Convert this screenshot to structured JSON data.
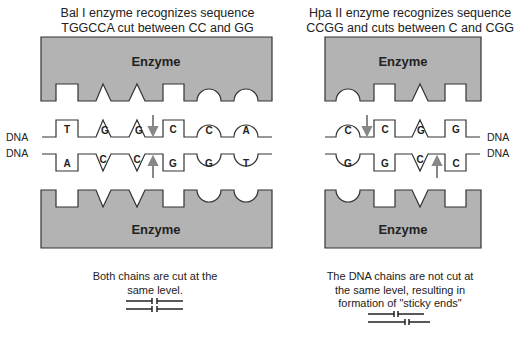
{
  "left_panel": {
    "title_line1": "Bal I enzyme recognizes sequence",
    "title_line2": "TGGCCA cut between CC and GG",
    "top_enzyme_label": "Enzyme",
    "bottom_enzyme_label": "Enzyme",
    "top_strand_label": "DNA",
    "bottom_strand_label": "DNA",
    "top_strand_bases": [
      "T",
      "G",
      "G",
      "C",
      "C",
      "A"
    ],
    "bottom_strand_bases": [
      "A",
      "C",
      "C",
      "G",
      "G",
      "T"
    ],
    "caption_line1": "Both chains are cut at the",
    "caption_line2": "same level."
  },
  "right_panel": {
    "title_line1": "Hpa II enzyme recognizes sequence",
    "title_line2": "CCGG and cuts between C and CGG",
    "top_enzyme_label": "Enzyme",
    "bottom_enzyme_label": "Enzyme",
    "top_strand_label": "DNA",
    "bottom_strand_label": "DNA",
    "top_strand_bases": [
      "C",
      "C",
      "G",
      "G"
    ],
    "bottom_strand_bases": [
      "G",
      "G",
      "C",
      "C"
    ],
    "caption_line1": "The DNA chains are not cut at",
    "caption_line2": "the same level, resulting in",
    "caption_line3": "formation of \"sticky ends\""
  },
  "colors": {
    "enzyme_fill": "#b3b3b3",
    "outline": "#333333",
    "arrow": "#888888"
  }
}
